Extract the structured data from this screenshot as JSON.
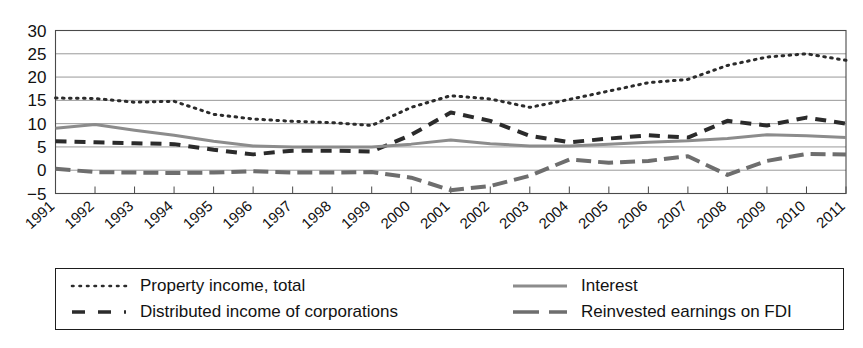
{
  "chart_data": {
    "type": "line",
    "title": "",
    "subtitle": "",
    "xlabel": "",
    "ylabel": "",
    "xlim": [
      1991,
      2011
    ],
    "ylim": [
      -5,
      30
    ],
    "yticks": [
      -5,
      0,
      5,
      10,
      15,
      20,
      25,
      30
    ],
    "ytick_labels": [
      "−5",
      "0",
      "5",
      "10",
      "15",
      "20",
      "25",
      "30"
    ],
    "grid": true,
    "grid_axis": "y",
    "legend_position": "below-plot",
    "legend_columns": 2,
    "x": [
      1991,
      1992,
      1993,
      1994,
      1995,
      1996,
      1997,
      1998,
      1999,
      2000,
      2001,
      2002,
      2003,
      2004,
      2005,
      2006,
      2007,
      2008,
      2009,
      2010,
      2011
    ],
    "categories": [
      "1991",
      "1992",
      "1993",
      "1994",
      "1995",
      "1996",
      "1997",
      "1998",
      "1999",
      "2000",
      "2001",
      "2002",
      "2003",
      "2004",
      "2005",
      "2006",
      "2007",
      "2008",
      "2009",
      "2010",
      "2011"
    ],
    "series": [
      {
        "name": "Property income, total",
        "style": "dotted",
        "color": "#2b2b2b",
        "values": [
          15.5,
          15.4,
          14.6,
          14.8,
          12.0,
          11.0,
          10.5,
          10.2,
          9.6,
          13.5,
          16.0,
          15.3,
          13.5,
          15.2,
          17.0,
          18.8,
          19.5,
          22.5,
          24.3,
          25.0,
          23.6
        ]
      },
      {
        "name": "Distributed income of corporations",
        "style": "dashed",
        "color": "#2b2b2b",
        "values": [
          6.2,
          6.0,
          5.8,
          5.6,
          4.4,
          3.4,
          4.2,
          4.2,
          4.0,
          7.6,
          12.4,
          10.6,
          7.4,
          6.0,
          6.8,
          7.5,
          7.0,
          10.6,
          9.6,
          11.3,
          10.0
        ]
      },
      {
        "name": "Interest",
        "style": "solid",
        "color": "#8c8c8c",
        "values": [
          9.0,
          9.8,
          8.6,
          7.5,
          6.2,
          5.2,
          5.0,
          5.0,
          5.0,
          5.6,
          6.5,
          5.7,
          5.2,
          5.2,
          5.6,
          6.0,
          6.3,
          6.8,
          7.6,
          7.4,
          7.0
        ]
      },
      {
        "name": "Reinvested earnings on FDI",
        "style": "longdash",
        "color": "#6e6e6e",
        "values": [
          0.3,
          -0.4,
          -0.5,
          -0.6,
          -0.5,
          -0.2,
          -0.5,
          -0.5,
          -0.4,
          -1.6,
          -4.3,
          -3.4,
          -1.2,
          2.3,
          1.6,
          2.0,
          3.0,
          -1.0,
          2.0,
          3.5,
          3.4
        ]
      }
    ]
  },
  "legend": {
    "items": [
      {
        "label": "Property income, total",
        "style": "dotted",
        "color": "#2b2b2b"
      },
      {
        "label": "Distributed income of corporations",
        "style": "dashed",
        "color": "#2b2b2b"
      },
      {
        "label": "Interest",
        "style": "solid",
        "color": "#8c8c8c"
      },
      {
        "label": "Reinvested earnings on FDI",
        "style": "longdash",
        "color": "#6e6e6e"
      }
    ]
  }
}
